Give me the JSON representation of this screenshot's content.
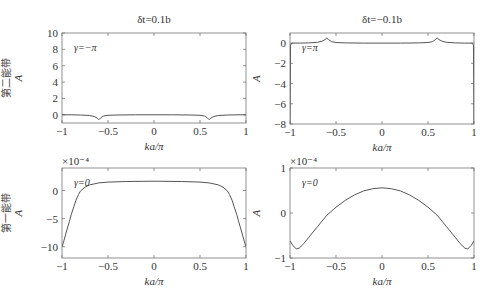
{
  "chart_data": [
    {
      "type": "line",
      "panel": "top-left",
      "title": "δt=0.1b",
      "xlabel": "ka/π",
      "ylabel": "A",
      "row_label": "第二能带",
      "annotation": "γ=−π",
      "xlim": [
        -1,
        1
      ],
      "ylim": [
        -1,
        10
      ],
      "xticks": [
        -1,
        -0.5,
        0,
        0.5,
        1
      ],
      "xtick_labels": [
        "−1",
        "−0.5",
        "0",
        "0.5",
        "1"
      ],
      "yticks": [
        0,
        2,
        4,
        6,
        8,
        10
      ],
      "ytick_labels": [
        "0",
        "2",
        "4",
        "6",
        "8",
        "10"
      ],
      "scale_label": "",
      "box": {
        "left": 62,
        "top": 33,
        "right": 246,
        "bottom": 123
      },
      "x": [
        -1,
        -0.9,
        -0.8,
        -0.7,
        -0.65,
        -0.62,
        -0.6,
        -0.58,
        -0.55,
        -0.5,
        -0.4,
        -0.2,
        0,
        0.2,
        0.4,
        0.5,
        0.55,
        0.58,
        0.6,
        0.62,
        0.65,
        0.7,
        0.8,
        0.9,
        1
      ],
      "y": [
        0,
        0,
        -0.02,
        -0.08,
        -0.2,
        -0.38,
        -0.6,
        -0.38,
        -0.15,
        -0.06,
        -0.02,
        0,
        0,
        0,
        -0.02,
        -0.06,
        -0.15,
        -0.38,
        -0.6,
        -0.38,
        -0.2,
        -0.08,
        -0.02,
        0,
        0
      ]
    },
    {
      "type": "line",
      "panel": "top-right",
      "title": "δt=−0.1b",
      "xlabel": "ka/π",
      "ylabel": "A",
      "annotation": "γ=π",
      "xlim": [
        -1,
        1
      ],
      "ylim": [
        -8,
        1
      ],
      "xticks": [
        -1,
        -0.5,
        0,
        0.5,
        1
      ],
      "xtick_labels": [
        "−1",
        "−0.5",
        "0",
        "0.5",
        "1"
      ],
      "yticks": [
        -8,
        -6,
        -4,
        -2,
        0
      ],
      "ytick_labels": [
        "−8",
        "−6",
        "−4",
        "−2",
        "0"
      ],
      "scale_label": "",
      "box": {
        "left": 290,
        "top": 33,
        "right": 474,
        "bottom": 124
      },
      "x": [
        -1,
        -0.995,
        -0.98,
        -0.9,
        -0.8,
        -0.7,
        -0.65,
        -0.62,
        -0.6,
        -0.58,
        -0.55,
        -0.5,
        -0.4,
        -0.2,
        0,
        0.2,
        0.4,
        0.5,
        0.55,
        0.58,
        0.6,
        0.62,
        0.65,
        0.7,
        0.8,
        0.9,
        0.98,
        0.995,
        1
      ],
      "y": [
        -8,
        -0.2,
        0,
        0,
        0.02,
        0.08,
        0.2,
        0.35,
        0.5,
        0.35,
        0.15,
        0.06,
        0.02,
        0,
        0,
        0,
        0.02,
        0.06,
        0.15,
        0.35,
        0.5,
        0.35,
        0.2,
        0.08,
        0.02,
        0,
        0,
        -0.2,
        -8
      ]
    },
    {
      "type": "line",
      "panel": "bottom-left",
      "title": "",
      "xlabel": "ka/π",
      "ylabel": "A",
      "row_label": "第一能带",
      "annotation": "γ=0",
      "xlim": [
        -1,
        1
      ],
      "ylim": [
        -12,
        4
      ],
      "xticks": [
        -1,
        -0.5,
        0,
        0.5,
        1
      ],
      "xtick_labels": [
        "−1",
        "−0.5",
        "0",
        "0.5",
        "1"
      ],
      "yticks": [
        -10,
        -5,
        0
      ],
      "ytick_labels": [
        "−10",
        "−5",
        "0"
      ],
      "scale_label": "×10⁻⁴",
      "box": {
        "left": 62,
        "top": 168,
        "right": 246,
        "bottom": 258
      },
      "x": [
        -1,
        -0.98,
        -0.95,
        -0.92,
        -0.9,
        -0.87,
        -0.85,
        -0.82,
        -0.8,
        -0.75,
        -0.7,
        -0.6,
        -0.5,
        -0.3,
        0,
        0.3,
        0.5,
        0.6,
        0.7,
        0.75,
        0.8,
        0.82,
        0.85,
        0.87,
        0.9,
        0.92,
        0.95,
        0.98,
        1
      ],
      "y": [
        -10,
        -9,
        -7.2,
        -5.5,
        -4.3,
        -2.8,
        -1.8,
        -0.7,
        -0.1,
        0.6,
        1.0,
        1.35,
        1.5,
        1.6,
        1.65,
        1.6,
        1.5,
        1.35,
        1.0,
        0.6,
        -0.1,
        -0.7,
        -1.8,
        -2.8,
        -4.3,
        -5.5,
        -7.2,
        -9,
        -10
      ]
    },
    {
      "type": "line",
      "panel": "bottom-right",
      "title": "",
      "xlabel": "ka/π",
      "ylabel": "A",
      "annotation": "γ=0",
      "xlim": [
        -1,
        1
      ],
      "ylim": [
        -1,
        1
      ],
      "xticks": [
        -1,
        -0.5,
        0,
        0.5,
        1
      ],
      "xtick_labels": [
        "−1",
        "−0.5",
        "0",
        "0.5",
        "1"
      ],
      "yticks": [
        -1,
        0,
        1
      ],
      "ytick_labels": [
        "−1",
        "0",
        "1"
      ],
      "scale_label": "×10⁻⁴",
      "box": {
        "left": 290,
        "top": 168,
        "right": 474,
        "bottom": 258
      },
      "x": [
        -1,
        -0.97,
        -0.93,
        -0.9,
        -0.85,
        -0.8,
        -0.7,
        -0.6,
        -0.5,
        -0.4,
        -0.3,
        -0.2,
        -0.1,
        0,
        0.1,
        0.2,
        0.3,
        0.4,
        0.5,
        0.6,
        0.7,
        0.8,
        0.85,
        0.9,
        0.93,
        0.97,
        1
      ],
      "y": [
        -0.62,
        -0.72,
        -0.8,
        -0.78,
        -0.68,
        -0.55,
        -0.3,
        -0.05,
        0.13,
        0.28,
        0.4,
        0.49,
        0.54,
        0.56,
        0.54,
        0.49,
        0.4,
        0.28,
        0.13,
        -0.05,
        -0.3,
        -0.55,
        -0.68,
        -0.78,
        -0.8,
        -0.72,
        -0.62
      ]
    }
  ]
}
